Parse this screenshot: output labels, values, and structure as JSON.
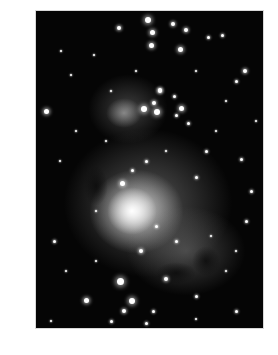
{
  "image": {
    "subject": "Orion Nebula star field",
    "colors": {
      "background": "#ffffff",
      "sky": "#050505",
      "nebula": "#d0d0d0",
      "core": "#ffffff"
    },
    "frame": {
      "left": 36,
      "top": 11,
      "width": 227,
      "height": 317
    },
    "nebulae": [
      {
        "x": 112,
        "y": 192,
        "w": 170,
        "h": 150,
        "c": "rgba(150,150,150,0.55)"
      },
      {
        "x": 100,
        "y": 200,
        "w": 95,
        "h": 85,
        "c": "rgba(230,230,230,0.85)"
      },
      {
        "x": 96,
        "y": 200,
        "w": 50,
        "h": 48,
        "c": "rgba(255,255,255,1)"
      },
      {
        "x": 150,
        "y": 240,
        "w": 120,
        "h": 90,
        "c": "rgba(120,120,120,0.55)"
      },
      {
        "x": 92,
        "y": 98,
        "w": 80,
        "h": 70,
        "c": "rgba(120,120,120,0.5)"
      },
      {
        "x": 88,
        "y": 102,
        "w": 36,
        "h": 30,
        "c": "rgba(190,190,190,0.6)"
      }
    ],
    "dark_lanes": [
      {
        "x": 140,
        "y": 262,
        "w": 40,
        "h": 22
      },
      {
        "x": 170,
        "y": 250,
        "w": 28,
        "h": 30
      },
      {
        "x": 60,
        "y": 175,
        "w": 24,
        "h": 40
      }
    ],
    "stars": [
      [
        112,
        9,
        3
      ],
      [
        116,
        21,
        2.5
      ],
      [
        115,
        34,
        2.5
      ],
      [
        144,
        38,
        2.5
      ],
      [
        150,
        19,
        2
      ],
      [
        137,
        13,
        2
      ],
      [
        186,
        24,
        1.5
      ],
      [
        209,
        60,
        2
      ],
      [
        10,
        100,
        2.5
      ],
      [
        124,
        80,
        2
      ],
      [
        140,
        104,
        1.5
      ],
      [
        172,
        26,
        1.5
      ],
      [
        83,
        17,
        2
      ],
      [
        58,
        44,
        1
      ],
      [
        35,
        64,
        1
      ],
      [
        200,
        70,
        1.5
      ],
      [
        124,
        79,
        2
      ],
      [
        118,
        92,
        2
      ],
      [
        108,
        98,
        3
      ],
      [
        121,
        101,
        3
      ],
      [
        145,
        97,
        2.5
      ],
      [
        138,
        85,
        1.5
      ],
      [
        152,
        112,
        1.5
      ],
      [
        96,
        159,
        1.5
      ],
      [
        86,
        172,
        2.5
      ],
      [
        160,
        166,
        1.5
      ],
      [
        205,
        148,
        1.5
      ],
      [
        24,
        150,
        1
      ],
      [
        18,
        230,
        1.5
      ],
      [
        210,
        210,
        1.5
      ],
      [
        105,
        240,
        2
      ],
      [
        130,
        268,
        2
      ],
      [
        84,
        270,
        3.5
      ],
      [
        50,
        289,
        2.5
      ],
      [
        96,
        290,
        3
      ],
      [
        88,
        300,
        2
      ],
      [
        117,
        300,
        1.5
      ],
      [
        190,
        260,
        1
      ],
      [
        200,
        300,
        1.5
      ],
      [
        160,
        308,
        1
      ],
      [
        30,
        260,
        1
      ],
      [
        60,
        250,
        1
      ],
      [
        180,
        120,
        1
      ],
      [
        215,
        180,
        1.5
      ],
      [
        70,
        130,
        1
      ],
      [
        40,
        120,
        1
      ],
      [
        25,
        40,
        1
      ],
      [
        190,
        90,
        1
      ],
      [
        160,
        60,
        1
      ],
      [
        100,
        60,
        1
      ],
      [
        75,
        80,
        1
      ],
      [
        220,
        110,
        1
      ],
      [
        110,
        150,
        1.5
      ],
      [
        130,
        140,
        1
      ],
      [
        170,
        140,
        1.5
      ],
      [
        60,
        200,
        1
      ],
      [
        200,
        240,
        1
      ],
      [
        160,
        285,
        1.5
      ],
      [
        140,
        230,
        1.5
      ],
      [
        120,
        215,
        1.5
      ],
      [
        175,
        225,
        1
      ],
      [
        75,
        310,
        1.5
      ],
      [
        110,
        312,
        1.5
      ],
      [
        15,
        310,
        1
      ],
      [
        205,
        320,
        1
      ]
    ]
  }
}
